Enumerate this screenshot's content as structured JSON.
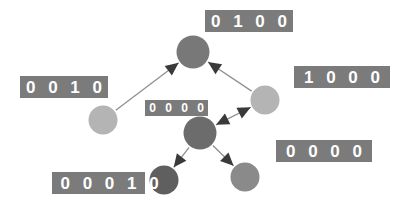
{
  "figure": {
    "background_color": "#ffffff",
    "label_background_color": "#7b7b7b",
    "label_text_color": "#ffffff",
    "edge_color": "#8f8f8f",
    "arrowhead_color": "#3a3a3a"
  },
  "nodes": [
    {
      "id": "n-000100",
      "label": "0 0 0 1 0 0",
      "color": "#b4b4b4",
      "cx": 103,
      "cy": 120,
      "r": 14.5
    },
    {
      "id": "n-001000",
      "label": "0 0 1 0 0 0",
      "color": "#787878",
      "cx": 193,
      "cy": 52,
      "r": 16.5
    },
    {
      "id": "n-010000",
      "label": "0 1 0 0 0 0",
      "color": "#b4b4b4",
      "cx": 265,
      "cy": 100,
      "r": 14.5
    },
    {
      "id": "n-000001",
      "label": "0 0 0 0 0 1",
      "color": "#6c6c6c",
      "cx": 200,
      "cy": 133,
      "r": 16.5
    },
    {
      "id": "n-000010",
      "label": "0 0 0 0 1 0",
      "color": "#5f5f5f",
      "cx": 164,
      "cy": 180,
      "r": 14.5
    },
    {
      "id": "n-100000",
      "label": "1 0 0 0 0 0",
      "color": "#8a8a8a",
      "cx": 245,
      "cy": 177,
      "r": 14.5
    }
  ],
  "labels": [
    {
      "id": "label-001000",
      "text": "0 0 1 0 0 0",
      "size": "big",
      "left": 205,
      "top": 10,
      "width": 88
    },
    {
      "id": "label-000100",
      "text": "0 0 0 1 0 0",
      "size": "big",
      "left": 20,
      "top": 76,
      "width": 88
    },
    {
      "id": "label-010000",
      "text": "0 1 0 0 0 0",
      "size": "big",
      "left": 294,
      "top": 66,
      "width": 96
    },
    {
      "id": "label-000001",
      "text": "0 0 0 0 0 1",
      "size": "small",
      "left": 145,
      "top": 100,
      "width": 63
    },
    {
      "id": "label-100000",
      "text": "1 0 0 0 0 0",
      "size": "big",
      "left": 276,
      "top": 140,
      "width": 96
    },
    {
      "id": "label-000010",
      "text": "0 0 0 0 1 0",
      "size": "big",
      "left": 52,
      "top": 172,
      "width": 93
    }
  ],
  "edges": [
    {
      "id": "edge-000100-to-001000",
      "from": "n-000100",
      "to": "n-001000",
      "direction": "one-way"
    },
    {
      "id": "edge-010000-to-001000",
      "from": "n-010000",
      "to": "n-001000",
      "direction": "one-way"
    },
    {
      "id": "edge-000001-010000",
      "from": "n-000001",
      "to": "n-010000",
      "direction": "two-way"
    },
    {
      "id": "edge-000001-to-000010",
      "from": "n-000001",
      "to": "n-000010",
      "direction": "one-way"
    },
    {
      "id": "edge-000001-to-100000",
      "from": "n-000001",
      "to": "n-100000",
      "direction": "one-way"
    }
  ]
}
